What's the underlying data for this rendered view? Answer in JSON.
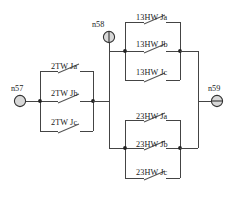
{
  "diagram": {
    "nodes": [
      {
        "id": "n57",
        "label": "n57",
        "symbol": "terminal-circle-plain",
        "x": 20,
        "y": 101,
        "label_x": 11,
        "label_y": 84
      },
      {
        "id": "n58",
        "label": "n58",
        "symbol": "terminal-circle-vertical-bar",
        "x": 109,
        "y": 37,
        "label_x": 92,
        "label_y": 20
      },
      {
        "id": "n59",
        "label": "n59",
        "symbol": "terminal-circle-horizontal-bar",
        "x": 217,
        "y": 101,
        "label_x": 208,
        "label_y": 84
      }
    ],
    "groups": [
      {
        "id": "group-2tw",
        "name": "2TW",
        "branches": [
          {
            "id": "sw-2tw-ja",
            "label": "2TW Ja",
            "label_x": 51,
            "label_y": 62,
            "row": "top"
          },
          {
            "id": "sw-2tw-jb",
            "label": "2TW Jb",
            "label_x": 51,
            "label_y": 89,
            "row": "middle"
          },
          {
            "id": "sw-2tw-jc",
            "label": "2TW Jc",
            "label_x": 51,
            "label_y": 118,
            "row": "bottom"
          }
        ]
      },
      {
        "id": "group-13hw",
        "name": "13HW",
        "branches": [
          {
            "id": "sw-13hw-ja",
            "label": "13HW Ja",
            "label_x": 136,
            "label_y": 13,
            "row": "top"
          },
          {
            "id": "sw-13hw-jb",
            "label": "13HW Jb",
            "label_x": 136,
            "label_y": 40,
            "row": "middle"
          },
          {
            "id": "sw-13hw-jc",
            "label": "13HW Jc",
            "label_x": 136,
            "label_y": 68,
            "row": "bottom"
          }
        ]
      },
      {
        "id": "group-23hw",
        "name": "23HW",
        "branches": [
          {
            "id": "sw-23hw-ja",
            "label": "23HW Ja",
            "label_x": 136,
            "label_y": 112,
            "row": "top"
          },
          {
            "id": "sw-23hw-jb",
            "label": "23HW Jb",
            "label_x": 136,
            "label_y": 140,
            "row": "middle"
          },
          {
            "id": "sw-23hw-jc",
            "label": "23HW Jc",
            "label_x": 136,
            "label_y": 168,
            "row": "bottom"
          }
        ]
      }
    ]
  }
}
